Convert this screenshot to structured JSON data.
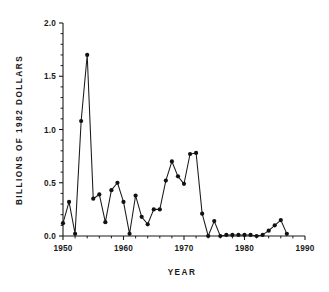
{
  "chart_data": {
    "type": "line",
    "title": "",
    "xlabel": "YEAR",
    "ylabel": "BILLIONS OF 1982 DOLLARS",
    "xlim": [
      1950,
      1990
    ],
    "ylim": [
      0.0,
      2.0
    ],
    "grid": false,
    "legend": "none",
    "marker": "filled-circle",
    "x_ticks": [
      1950,
      1960,
      1970,
      1980,
      1990
    ],
    "x_tick_labels": [
      "1950",
      "1960",
      "1970",
      "1980",
      "1990"
    ],
    "x_minor_tick_interval": 2,
    "y_ticks": [
      0.0,
      0.5,
      1.0,
      1.5,
      2.0
    ],
    "y_tick_labels": [
      "0.0",
      "0.5",
      "1.0",
      "1.5",
      "2.0"
    ],
    "y_minor_tick_interval": 0.1,
    "series": [
      {
        "name": "Expenditures",
        "x": [
          1950,
          1951,
          1952,
          1953,
          1954,
          1955,
          1956,
          1957,
          1958,
          1959,
          1960,
          1961,
          1962,
          1963,
          1964,
          1965,
          1966,
          1967,
          1968,
          1969,
          1970,
          1971,
          1972,
          1973,
          1974,
          1975,
          1976,
          1977,
          1978,
          1979,
          1980,
          1981,
          1982,
          1983,
          1984,
          1985,
          1986,
          1987
        ],
        "values": [
          0.12,
          0.32,
          0.02,
          1.08,
          1.7,
          0.35,
          0.39,
          0.13,
          0.43,
          0.5,
          0.32,
          0.02,
          0.38,
          0.18,
          0.11,
          0.25,
          0.25,
          0.52,
          0.7,
          0.56,
          0.49,
          0.77,
          0.78,
          0.21,
          0.0,
          0.14,
          0.0,
          0.01,
          0.01,
          0.01,
          0.01,
          0.01,
          0.0,
          0.01,
          0.05,
          0.1,
          0.15,
          0.02
        ]
      }
    ]
  },
  "axes": {
    "y_title": "BILLIONS OF 1982 DOLLARS",
    "x_title": "YEAR"
  }
}
